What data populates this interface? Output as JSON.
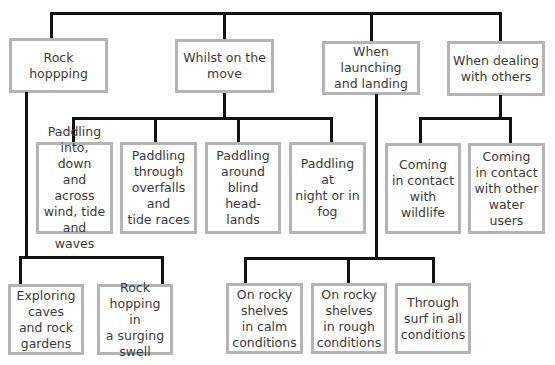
{
  "diagram": {
    "level1": [
      {
        "id": "rock-hopping",
        "label": "Rock hoppping"
      },
      {
        "id": "whilst-on-move",
        "label": "Whilst on the\nmove"
      },
      {
        "id": "launching-landing",
        "label": "When launching\nand landing"
      },
      {
        "id": "dealing-others",
        "label": "When dealing\nwith others"
      }
    ],
    "whilst_on_move_children": [
      {
        "label": "Paddling\ninto, down\nand across\nwind, tide\nand waves"
      },
      {
        "label": "Paddling\nthrough\noverfalls and\ntide races"
      },
      {
        "label": "Paddling\naround\nblind head-\nlands"
      },
      {
        "label": "Paddling at\nnight or in\nfog"
      }
    ],
    "dealing_others_children": [
      {
        "label": "Coming\nin contact\nwith\nwildlife"
      },
      {
        "label": "Coming\nin contact\nwith other\nwater users"
      }
    ],
    "rock_hopping_children": [
      {
        "label": "Exploring\ncaves\nand rock\ngardens"
      },
      {
        "label": "Rock\nhopping in\na surging\nswell"
      }
    ],
    "launching_landing_children": [
      {
        "label": "On rocky\nshelves\nin calm\nconditions"
      },
      {
        "label": "On rocky\nshelves\nin rough\nconditions"
      },
      {
        "label": "Through\nsurf in all\nconditions"
      }
    ],
    "colors": {
      "line": "#111111",
      "box_border": "#b4b4b4",
      "text": "#3a3a3a"
    }
  }
}
